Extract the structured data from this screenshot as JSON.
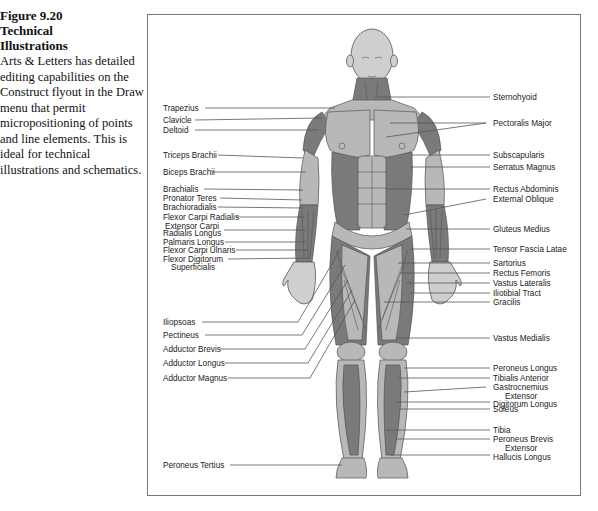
{
  "caption": {
    "figure_number": "Figure 9.20",
    "title_line1": "Technical",
    "title_line2": "Illustrations",
    "body": "Arts & Letters has detailed editing capabilities on the Construct flyout in the Draw menu that permit micropositioning of points and line elements. This is ideal for technical illustrations and schematics."
  },
  "illustration": {
    "left_labels": [
      {
        "text": "Trapezius",
        "y": 108
      },
      {
        "text": "Clavicle",
        "y": 120
      },
      {
        "text": "Deltoid",
        "y": 130
      },
      {
        "text": "Triceps Brachii",
        "y": 155
      },
      {
        "text": "Biceps Brachii",
        "y": 172
      },
      {
        "text": "Brachialis",
        "y": 189
      },
      {
        "text": "Pronator Teres",
        "y": 198
      },
      {
        "text": "Brachioradialis",
        "y": 207
      },
      {
        "text": "Flexor Carpi Radialis",
        "y": 217
      },
      {
        "text": "Extensor Carpi",
        "y": 226
      },
      {
        "text": "Radialis Longus",
        "y": 233
      },
      {
        "text": "Palmaris Longus",
        "y": 242
      },
      {
        "text": "Flexor Carpi Ulnaris",
        "y": 250
      },
      {
        "text": "Flexor Digitorum",
        "y": 259
      },
      {
        "text": "Superficialis",
        "y": 267
      },
      {
        "text": "Iliopsoas",
        "y": 322
      },
      {
        "text": "Pectineus",
        "y": 335
      },
      {
        "text": "Adductor Brevis",
        "y": 349
      },
      {
        "text": "Adductor Longus",
        "y": 363
      },
      {
        "text": "Adductor Magnus",
        "y": 378
      },
      {
        "text": "Peroneus Tertius",
        "y": 465
      }
    ],
    "right_labels": [
      {
        "text": "Sternohyoid",
        "y": 97
      },
      {
        "text": "Pectoralis Major",
        "y": 123
      },
      {
        "text": "Subscapularis",
        "y": 155
      },
      {
        "text": "Serratus Magnus",
        "y": 167
      },
      {
        "text": "Rectus Abdominis",
        "y": 189
      },
      {
        "text": "External Oblique",
        "y": 199
      },
      {
        "text": "Gluteus Medius",
        "y": 229
      },
      {
        "text": "Tensor Fascia Latae",
        "y": 249
      },
      {
        "text": "Sartorius",
        "y": 263
      },
      {
        "text": "Rectus Femoris",
        "y": 273
      },
      {
        "text": "Vastus Lateralis",
        "y": 283
      },
      {
        "text": "Iliotibial Tract",
        "y": 293
      },
      {
        "text": "Gracilis",
        "y": 302
      },
      {
        "text": "Vastus Medialis",
        "y": 338
      },
      {
        "text": "Peroneus Longus",
        "y": 368
      },
      {
        "text": "Tibialis Anterior",
        "y": 378
      },
      {
        "text": "Gastrocnemius",
        "y": 387
      },
      {
        "text": "Extensor",
        "y": 396
      },
      {
        "text": "Digitorum Longus",
        "y": 404
      },
      {
        "text": "Soleus",
        "y": 409
      },
      {
        "text": "Tibia",
        "y": 430
      },
      {
        "text": "Peroneus Brevis",
        "y": 439
      },
      {
        "text": "Extensor",
        "y": 448
      },
      {
        "text": "Hallucis Longus",
        "y": 457
      }
    ]
  }
}
